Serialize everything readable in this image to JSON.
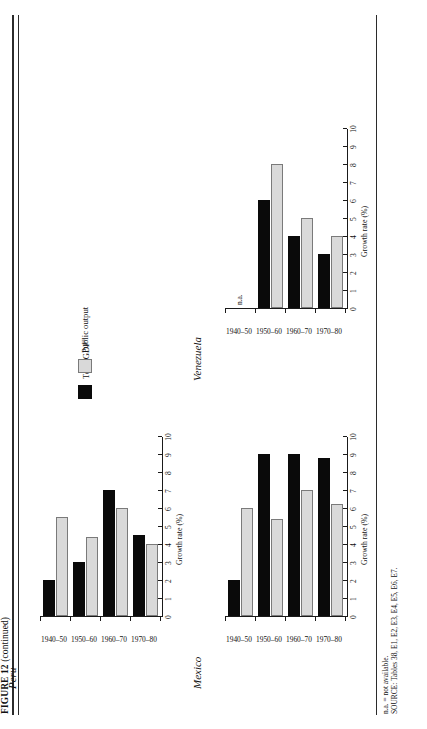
{
  "figure": {
    "label": "FIGURE 12",
    "continued": "(continued)"
  },
  "legend": {
    "title": "",
    "items": [
      {
        "key": "gdp",
        "label": "Total GDP",
        "superscript": "a",
        "color": "#0a0a0a"
      },
      {
        "key": "pub",
        "label": "Public output",
        "superscript": "",
        "color": "#d9d9d9"
      }
    ]
  },
  "notes": {
    "na": "n.a. = not available.",
    "source": "SOURCE: Tables 38, E1, E2, E3, E4, E5, E6, E7."
  },
  "axis": {
    "y_title": "Growth rate (%)",
    "y_ticks": [
      "10",
      "9",
      "8",
      "7",
      "6",
      "5",
      "4",
      "3",
      "2",
      "1",
      "0"
    ],
    "y_min": 0,
    "y_max": 10,
    "categories": [
      "1940–50",
      "1950–60",
      "1960–70",
      "1970–80"
    ]
  },
  "chart_data": [
    {
      "type": "bar",
      "title": "Peru",
      "xlabel": "",
      "ylabel": "Growth rate (%)",
      "ylim": [
        0,
        10
      ],
      "grid": false,
      "legend_position": "center",
      "categories": [
        "1940–50",
        "1950–60",
        "1960–70",
        "1970–80"
      ],
      "series": [
        {
          "name": "Total GDP",
          "values": [
            2.0,
            3.0,
            7.0,
            4.5
          ]
        },
        {
          "name": "Public output",
          "values": [
            5.5,
            4.4,
            6.0,
            4.0
          ]
        }
      ]
    },
    {
      "type": "bar",
      "title": "Mexico",
      "xlabel": "",
      "ylabel": "Growth rate (%)",
      "ylim": [
        0,
        10
      ],
      "grid": false,
      "legend_position": "center",
      "categories": [
        "1940–50",
        "1950–60",
        "1960–70",
        "1970–80"
      ],
      "series": [
        {
          "name": "Total GDP",
          "values": [
            2.0,
            9.0,
            9.0,
            8.8
          ]
        },
        {
          "name": "Public output",
          "values": [
            6.0,
            5.4,
            7.0,
            6.2
          ]
        }
      ]
    },
    {
      "type": "bar",
      "title": "Venezuela",
      "xlabel": "",
      "ylabel": "Growth rate (%)",
      "ylim": [
        0,
        10
      ],
      "grid": false,
      "legend_position": "center",
      "na_label": "n.a.",
      "categories": [
        "1940–50",
        "1950–60",
        "1960–70",
        "1970–80"
      ],
      "series": [
        {
          "name": "Total GDP",
          "values": [
            null,
            6.0,
            4.0,
            3.0
          ]
        },
        {
          "name": "Public output",
          "values": [
            null,
            8.0,
            5.0,
            4.0
          ]
        }
      ]
    }
  ]
}
